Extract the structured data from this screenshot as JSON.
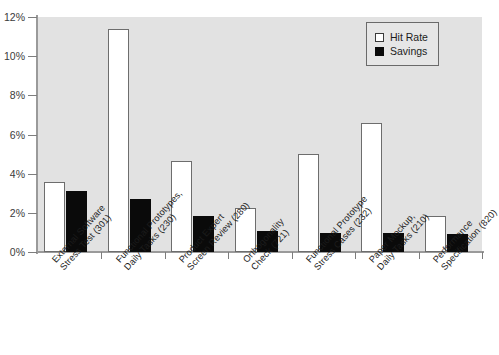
{
  "chart_data": {
    "type": "bar",
    "title": "",
    "xlabel": "",
    "ylabel": "",
    "ylim": [
      0,
      12
    ],
    "ytick_labels": [
      "0%",
      "2%",
      "4%",
      "6%",
      "8%",
      "10%",
      "12%"
    ],
    "ytick_values": [
      0,
      2,
      4,
      6,
      8,
      10,
      12
    ],
    "grid": false,
    "legend_position": "top-right",
    "categories": [
      "External Software Stress Test (301)",
      "Functional Prototypes, Daily Tasks (230)",
      "Product Expert Screen Review (280)",
      "Orthogonality Check (721)",
      "Functional Prototype Stress Cases (232)",
      "Paper Mockup, Daily Tasks (210)",
      "Performance Specification (820)"
    ],
    "category_lines": [
      [
        "External Software",
        "Stress Test (301)"
      ],
      [
        "Functional Prototypes,",
        "Daily Tasks (230)"
      ],
      [
        "Product Expert",
        "Screen Review (280)"
      ],
      [
        "Orthogonality",
        "Check (721)"
      ],
      [
        "Functional Prototype",
        "Stress Cases (232)"
      ],
      [
        "Paper Mockup,",
        "Daily Tasks (210)"
      ],
      [
        "Performance",
        "Specification (820)"
      ]
    ],
    "series": [
      {
        "name": "Hit Rate",
        "color": "#ffffff",
        "values": [
          3.6,
          11.4,
          4.65,
          2.25,
          5.0,
          6.6,
          1.85
        ]
      },
      {
        "name": "Savings",
        "color": "#000000",
        "values": [
          3.1,
          2.7,
          1.85,
          1.05,
          0.95,
          0.95,
          0.9
        ]
      }
    ]
  },
  "legend": {
    "items": [
      {
        "label": "Hit Rate",
        "swatch": "hollow-square"
      },
      {
        "label": "Savings",
        "swatch": "filled-square"
      }
    ]
  },
  "colors": {
    "plot_background": "#e2e2e2",
    "page_background": "#ffffff",
    "axis": "#9a9a9a",
    "hit_rate": "#ffffff",
    "savings": "#000000",
    "text": "#1c1c1c"
  }
}
